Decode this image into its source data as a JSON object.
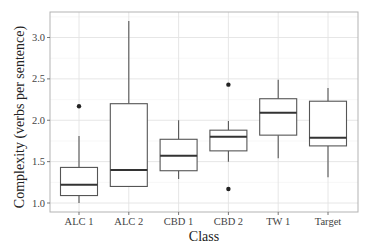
{
  "chart_data": {
    "type": "boxplot",
    "title": "",
    "xlabel": "Class",
    "ylabel": "Complexity (verbs per sentence)",
    "ylim": [
      0.9,
      3.25
    ],
    "yticks": [
      1.0,
      1.5,
      2.0,
      2.5,
      3.0
    ],
    "ytick_labels": [
      "1.0",
      "1.5",
      "2.0",
      "2.5",
      "3.0"
    ],
    "grid": true,
    "legend": null,
    "categories": [
      "ALC 1",
      "ALC 2",
      "CBD 1",
      "CBD 2",
      "TW 1",
      "Target"
    ],
    "boxes": [
      {
        "label": "ALC 1",
        "whisker_low": 1.0,
        "q1": 1.09,
        "median": 1.22,
        "q3": 1.43,
        "whisker_high": 1.81,
        "outliers": [
          2.17
        ]
      },
      {
        "label": "ALC 2",
        "whisker_low": 1.2,
        "q1": 1.2,
        "median": 1.4,
        "q3": 2.2,
        "whisker_high": 3.2,
        "outliers": []
      },
      {
        "label": "CBD 1",
        "whisker_low": 1.29,
        "q1": 1.39,
        "median": 1.57,
        "q3": 1.77,
        "whisker_high": 2.0,
        "outliers": []
      },
      {
        "label": "CBD 2",
        "whisker_low": 1.5,
        "q1": 1.63,
        "median": 1.8,
        "q3": 1.88,
        "whisker_high": 1.99,
        "outliers": [
          2.43,
          1.17
        ]
      },
      {
        "label": "TW 1",
        "whisker_low": 1.54,
        "q1": 1.82,
        "median": 2.09,
        "q3": 2.26,
        "whisker_high": 2.49,
        "outliers": []
      },
      {
        "label": "Target",
        "whisker_low": 1.31,
        "q1": 1.69,
        "median": 1.79,
        "q3": 2.23,
        "whisker_high": 2.39,
        "outliers": []
      }
    ]
  },
  "style": {
    "panel_border": "#b3b3b3",
    "grid_major": "#e3e3e3",
    "grid_minor": "#f1f1f1",
    "box_stroke": "#555555",
    "median_stroke": "#333333",
    "outlier_fill": "#222222"
  }
}
